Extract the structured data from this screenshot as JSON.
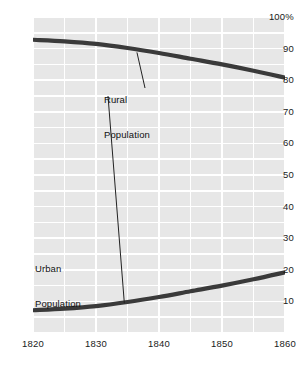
{
  "chart_data": {
    "type": "line",
    "title": "",
    "subtitle": "",
    "xlabel": "",
    "ylabel": "",
    "xlim": [
      1820,
      1860
    ],
    "ylim": [
      0,
      100
    ],
    "grid": true,
    "grid_spacing_x": 5,
    "grid_spacing_y": 5,
    "legend": "inline-annotations",
    "x_ticks": [
      1820,
      1830,
      1840,
      1850,
      1860
    ],
    "x_tick_labels": [
      "1820",
      "1830",
      "1840",
      "1850",
      "1860"
    ],
    "y_ticks": [
      10,
      20,
      30,
      40,
      50,
      60,
      70,
      80,
      90,
      100
    ],
    "y_tick_labels": [
      "10",
      "20",
      "30",
      "40",
      "50",
      "60",
      "70",
      "80",
      "90",
      "100%"
    ],
    "x": [
      1820,
      1825,
      1830,
      1835,
      1840,
      1845,
      1850,
      1855,
      1860
    ],
    "series": [
      {
        "name": "Rural Population",
        "color": "#3a3a3a",
        "values": [
          92.8,
          92.3,
          91.5,
          90.2,
          88.6,
          86.8,
          85.0,
          83.0,
          80.8
        ]
      },
      {
        "name": "Urban Population",
        "color": "#3a3a3a",
        "values": [
          7.2,
          7.7,
          8.5,
          9.8,
          11.4,
          13.2,
          15.0,
          17.0,
          19.2
        ]
      }
    ],
    "annotations": [
      {
        "id": "rural",
        "line1": "Rural",
        "line2": "Population",
        "points_to": [
          1836.5,
          88.8
        ]
      },
      {
        "id": "urban",
        "line1": "Urban",
        "line2": "Population",
        "points_to": [
          1834.5,
          9.4
        ]
      }
    ],
    "caption": ""
  },
  "axes": {
    "y_labels": [
      "100%",
      "90",
      "80",
      "70",
      "60",
      "50",
      "40",
      "30",
      "20",
      "10"
    ],
    "x_labels": [
      "1820",
      "1830",
      "1840",
      "1850",
      "1860"
    ]
  },
  "annotations": {
    "rural": {
      "line1": "Rural",
      "line2": "Population"
    },
    "urban": {
      "line1": "Urban",
      "line2": "Population"
    }
  },
  "colors": {
    "plot_background": "#e7e7e7",
    "gridline": "#ffffff",
    "series_line": "#3a3a3a",
    "text": "#1a1a1a",
    "page_background": "#ffffff"
  }
}
